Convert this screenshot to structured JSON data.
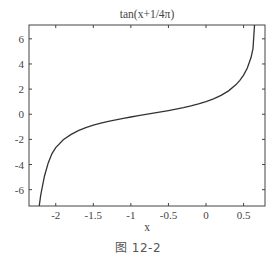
{
  "chart_data": {
    "type": "line",
    "title": "tan(x+1/4π)",
    "xlabel": "x",
    "ylabel": "",
    "xlim": [
      -2.356,
      0.785
    ],
    "ylim": [
      -7.3,
      7.1
    ],
    "grid": false,
    "legend": null,
    "xticks": [
      -2,
      -1.5,
      -1,
      -0.5,
      0,
      0.5
    ],
    "xtick_labels": [
      "-2",
      "-1.5",
      "-1",
      "-0.5",
      "0",
      "0.5"
    ],
    "yticks": [
      -6,
      -4,
      -2,
      0,
      2,
      4,
      6
    ],
    "ytick_labels": [
      "-6",
      "-4",
      "-2",
      "0",
      "2",
      "4",
      "6"
    ],
    "series": [
      {
        "name": "tan(x+π/4)",
        "color": "#333333",
        "x": [
          -2.22,
          -2.2,
          -2.15,
          -2.1,
          -2.05,
          -2.0,
          -1.9,
          -1.8,
          -1.7,
          -1.6,
          -1.5,
          -1.4,
          -1.3,
          -1.2,
          -1.1,
          -1.0,
          -0.9,
          -0.8,
          -0.7,
          -0.6,
          -0.5,
          -0.4,
          -0.3,
          -0.2,
          -0.1,
          0.0,
          0.1,
          0.2,
          0.3,
          0.4,
          0.45,
          0.5,
          0.55,
          0.6,
          0.625,
          0.6455
        ],
        "values": [
          -7.3,
          -6.43,
          -4.91,
          -3.87,
          -3.13,
          -2.65,
          -2.03,
          -1.62,
          -1.31,
          -1.07,
          -0.87,
          -0.71,
          -0.56,
          -0.44,
          -0.32,
          -0.22,
          -0.11,
          -0.015,
          0.09,
          0.19,
          0.29,
          0.4,
          0.52,
          0.66,
          0.82,
          1.0,
          1.22,
          1.5,
          1.86,
          2.36,
          2.7,
          3.11,
          3.68,
          4.53,
          5.21,
          7.1
        ]
      }
    ]
  },
  "figure": {
    "caption": "图 12-2"
  }
}
